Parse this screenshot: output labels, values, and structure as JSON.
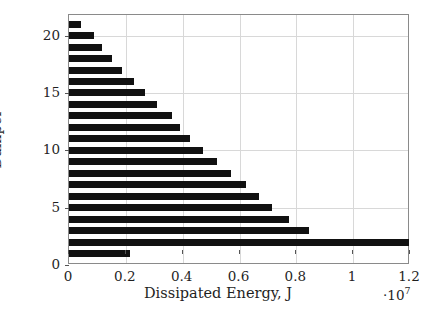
{
  "chart_data": {
    "type": "bar",
    "orientation": "horizontal",
    "title": "",
    "xlabel": "Dissipated Energy, J",
    "ylabel": "Damper",
    "x_multiplier": "·10",
    "x_multiplier_exp": "7",
    "xlim": [
      0,
      1.2
    ],
    "ylim": [
      0,
      21.8
    ],
    "xticks": [
      0,
      0.2,
      0.4,
      0.6,
      0.8,
      1,
      1.2
    ],
    "xtick_labels": [
      "0",
      "0.2",
      "0.4",
      "0.6",
      "0.8",
      "1",
      "1.2"
    ],
    "yticks": [
      0,
      5,
      10,
      15,
      20
    ],
    "ytick_labels": [
      "0",
      "5",
      "10",
      "15",
      "20"
    ],
    "grid": true,
    "grid_color": "#d8d8d8",
    "bar_color": "#111111",
    "frame_color": "#8a8a8a",
    "categories": [
      1,
      2,
      3,
      4,
      5,
      6,
      7,
      8,
      9,
      10,
      11,
      12,
      13,
      14,
      15,
      16,
      17,
      18,
      19,
      20,
      21
    ],
    "values": [
      0.213,
      1.195,
      0.845,
      0.775,
      0.715,
      0.667,
      0.623,
      0.571,
      0.522,
      0.47,
      0.427,
      0.392,
      0.361,
      0.309,
      0.268,
      0.23,
      0.186,
      0.15,
      0.116,
      0.088,
      0.042
    ],
    "value_units": "1e7 J"
  },
  "figure": {
    "width": 436,
    "height": 314,
    "background": "#ffffff"
  }
}
